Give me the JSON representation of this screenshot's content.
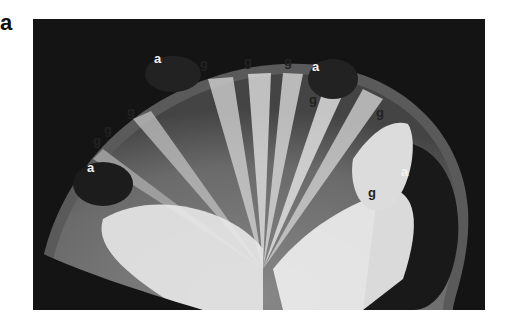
{
  "figure": {
    "panel_label": "a",
    "labels": [
      {
        "text": "a",
        "tone": "light",
        "x": 158,
        "y": 59
      },
      {
        "text": "g",
        "tone": "dark",
        "x": 204,
        "y": 64
      },
      {
        "text": "g",
        "tone": "dark",
        "x": 248,
        "y": 62
      },
      {
        "text": "g",
        "tone": "dark",
        "x": 288,
        "y": 62
      },
      {
        "text": "a",
        "tone": "light",
        "x": 316,
        "y": 67
      },
      {
        "text": "g",
        "tone": "dark",
        "x": 354,
        "y": 79
      },
      {
        "text": "g",
        "tone": "dark",
        "x": 313,
        "y": 100
      },
      {
        "text": "g",
        "tone": "dark",
        "x": 380,
        "y": 113
      },
      {
        "text": "g",
        "tone": "dark",
        "x": 131,
        "y": 112
      },
      {
        "text": "g",
        "tone": "dark",
        "x": 108,
        "y": 130
      },
      {
        "text": "g",
        "tone": "dark",
        "x": 97,
        "y": 141
      },
      {
        "text": "a",
        "tone": "light",
        "x": 91,
        "y": 168
      },
      {
        "text": "a",
        "tone": "light",
        "x": 405,
        "y": 172
      },
      {
        "text": "g",
        "tone": "dark",
        "x": 372,
        "y": 193
      }
    ]
  }
}
